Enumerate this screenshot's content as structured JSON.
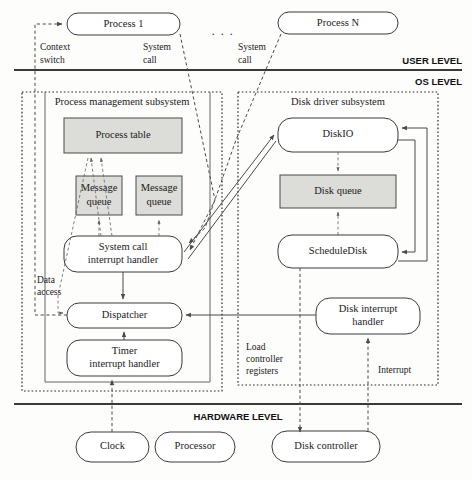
{
  "levels": [
    {
      "id": "user",
      "label": "USER LEVEL"
    },
    {
      "id": "os",
      "label": "OS LEVEL"
    },
    {
      "id": "hardware",
      "label": "HARDWARE LEVEL"
    }
  ],
  "user_level": {
    "processes": [
      {
        "id": "process_1",
        "label": "Process 1"
      },
      {
        "id": "process_n",
        "label": "Process N"
      }
    ],
    "ellipsis": ". . ."
  },
  "subsystems": [
    {
      "id": "process_mgmt",
      "label": "Process management subsystem"
    },
    {
      "id": "disk_driver",
      "label": "Disk driver subsystem"
    }
  ],
  "nodes": {
    "process_table": "Process table",
    "message_queue_1": "Message\nqueue",
    "message_queue_1_line1": "Message",
    "message_queue_1_line2": "queue",
    "message_queue_2_line1": "Message",
    "message_queue_2_line2": "queue",
    "syscall_handler_line1": "System call",
    "syscall_handler_line2": "interrupt handler",
    "dispatcher": "Dispatcher",
    "timer_handler_line1": "Timer",
    "timer_handler_line2": "interrupt handler",
    "diskio": "DiskIO",
    "disk_queue": "Disk queue",
    "schedule_disk": "ScheduleDisk",
    "disk_interrupt_line1": "Disk interrupt",
    "disk_interrupt_line2": "handler"
  },
  "hardware": [
    {
      "id": "clock",
      "label": "Clock"
    },
    {
      "id": "processor",
      "label": "Processor"
    },
    {
      "id": "disk_controller",
      "label": "Disk controller"
    }
  ],
  "edge_labels": {
    "context_switch_line1": "Context",
    "context_switch_line2": "switch",
    "system_call_left_line1": "System",
    "system_call_left_line2": "call",
    "system_call_right_line1": "System",
    "system_call_right_line2": "call",
    "data_access_line1": "Data",
    "data_access_line2": "access",
    "load_controller_line1": "Load",
    "load_controller_line2": "controller",
    "load_controller_line3": "registers",
    "interrupt": "Interrupt"
  },
  "colors": {
    "shaded_fill": "#dcdcd8",
    "node_stroke": "#3a3a3a",
    "background": "#fdfdfc",
    "text": "#1a1a1a"
  }
}
